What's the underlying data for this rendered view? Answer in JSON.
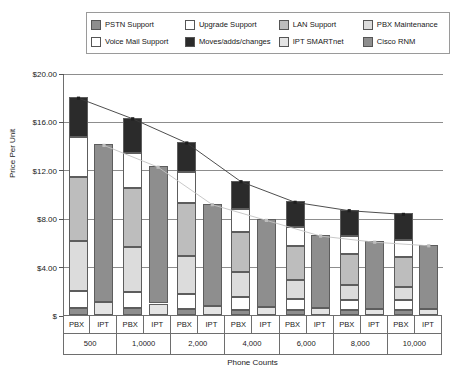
{
  "chart_data": {
    "type": "bar",
    "subtype": "stacked-bar-with-trendlines",
    "title": "",
    "xlabel": "Phone Counts",
    "ylabel": "Price Per Unit",
    "ylim": [
      0,
      20
    ],
    "ytick_values": [
      0,
      4,
      8,
      12,
      16,
      20
    ],
    "ytick_labels": [
      "$",
      "$4.00",
      "$8.00",
      "$12.00",
      "$16.00",
      "$20.00"
    ],
    "grid": true,
    "legend_position": "top",
    "categories": [
      "500",
      "1,0000",
      "2,000",
      "4,000",
      "6,000",
      "8,000",
      "10,000"
    ],
    "group_members": [
      "PBX",
      "IPT"
    ],
    "legend_entries": [
      {
        "label": "PSTN Support",
        "color": "#8e8e8e"
      },
      {
        "label": "Upgrade Support",
        "color": "#ffffff"
      },
      {
        "label": "LAN Support",
        "color": "#bdbdbd"
      },
      {
        "label": "PBX Maintenance",
        "color": "#dcdcdc"
      },
      {
        "label": "Voice Mail Support",
        "color": "#ffffff"
      },
      {
        "label": "Moves/adds/changes",
        "color": "#2b2b2b"
      },
      {
        "label": "IPT SMARTnet",
        "color": "#e4e4e4"
      },
      {
        "label": "Cisco RNM",
        "color": "#8e8e8e"
      }
    ],
    "series": [
      {
        "name": "PSTN Support",
        "bar": "PBX",
        "color": "#8e8e8e",
        "values": [
          0.55,
          0.55,
          0.5,
          0.45,
          0.45,
          0.4,
          0.4
        ]
      },
      {
        "name": "Voice Mail Support",
        "bar": "PBX",
        "color": "#ffffff",
        "values": [
          1.45,
          1.35,
          1.25,
          1.0,
          0.9,
          0.85,
          0.8
        ]
      },
      {
        "name": "PBX Maintenance",
        "bar": "PBX",
        "color": "#dcdcdc",
        "values": [
          4.1,
          3.7,
          3.1,
          2.1,
          1.55,
          1.25,
          1.15
        ]
      },
      {
        "name": "LAN Support",
        "bar": "PBX",
        "color": "#bdbdbd",
        "values": [
          5.3,
          4.9,
          4.4,
          3.35,
          2.8,
          2.55,
          2.45
        ]
      },
      {
        "name": "Upgrade Support",
        "bar": "PBX",
        "color": "#ffffff",
        "values": [
          3.3,
          2.9,
          2.55,
          1.9,
          1.6,
          1.45,
          1.4
        ]
      },
      {
        "name": "Moves/adds/changes",
        "bar": "PBX",
        "color": "#2b2b2b",
        "values": [
          3.3,
          2.9,
          2.5,
          2.3,
          2.1,
          2.2,
          2.2
        ]
      },
      {
        "name": "IPT SMARTnet",
        "bar": "IPT",
        "color": "#e4e4e4",
        "values": [
          1.1,
          0.95,
          0.75,
          0.65,
          0.55,
          0.5,
          0.5
        ]
      },
      {
        "name": "Cisco RNM",
        "bar": "IPT",
        "color": "#8e8e8e",
        "values": [
          13.0,
          11.35,
          8.45,
          7.25,
          6.05,
          5.6,
          5.3
        ]
      }
    ],
    "totals": {
      "PBX": [
        18.0,
        16.3,
        14.3,
        11.1,
        9.4,
        8.7,
        8.4
      ],
      "IPT": [
        14.1,
        12.3,
        9.2,
        7.9,
        6.6,
        6.1,
        5.8
      ]
    },
    "trendlines": [
      {
        "name": "PBX trend",
        "follows": "PBX",
        "color": "#3a3a3a",
        "marker": "square",
        "values": [
          18.0,
          16.3,
          14.3,
          11.1,
          9.4,
          8.7,
          8.4
        ]
      },
      {
        "name": "IPT trend",
        "follows": "IPT",
        "color": "#c2c2c2",
        "marker": "square",
        "values": [
          14.1,
          12.3,
          9.2,
          7.9,
          6.6,
          6.1,
          5.8
        ]
      }
    ]
  }
}
